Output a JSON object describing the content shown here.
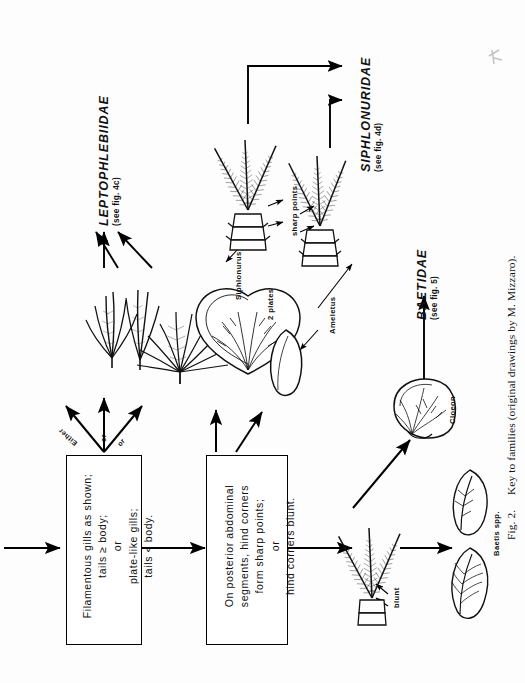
{
  "figure": {
    "caption": "Fig. 2.   Key to families (original drawings by M. Mizzaro).",
    "caption_number": "Fig. 2.",
    "caption_text": "Key to families (original drawings by M. Mizzaro)."
  },
  "boxes": [
    {
      "id": "box-gills",
      "lines": [
        "Filamentous gills as shown;",
        "tails ≥ body;",
        "or",
        "plate-like gills;",
        "tails < body."
      ]
    },
    {
      "id": "box-abdomen",
      "lines": [
        "On posterior abdominal",
        "segments, hind corners",
        "form sharp points;",
        "or",
        "hind corners blunt."
      ]
    }
  ],
  "branch_labels": [
    {
      "id": "either",
      "text": "Either"
    },
    {
      "id": "or-1",
      "text": "or"
    },
    {
      "id": "or-2",
      "text": "or"
    }
  ],
  "families": [
    {
      "id": "leptophlebiidae",
      "name": "LEPTOPHLEBIIDAE",
      "reference": "(see fig. 4c)"
    },
    {
      "id": "siphlonuridae",
      "name": "SIPHLONURIDAE",
      "reference": "(see fig. 4d)"
    },
    {
      "id": "baetidae",
      "name": "BAETIDAE",
      "reference": "(see fig. 5)"
    }
  ],
  "annotations": [
    {
      "id": "siphlonurus",
      "text": "Siphlonurus"
    },
    {
      "id": "two-plates",
      "text": "2 plates"
    },
    {
      "id": "sharp-points",
      "text": "sharp points"
    },
    {
      "id": "ameletus",
      "text": "Ameletus"
    },
    {
      "id": "blunt",
      "text": "blunt"
    },
    {
      "id": "cloeon",
      "text": "Cloeon"
    },
    {
      "id": "baetis-spp",
      "text": "Baetis spp."
    }
  ],
  "colors": {
    "ink": "#000000",
    "paper": "#fdfdfd",
    "drawing": "#1a1a1a"
  }
}
